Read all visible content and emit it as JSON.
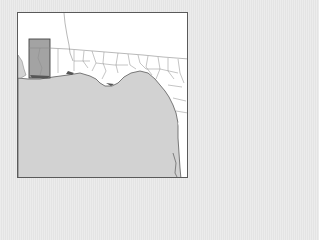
{
  "map": {
    "title": "Florida Panhandle county locator map",
    "highlighted_region": "Escambia County area",
    "colors": {
      "land": "#ffffff",
      "water": "#d2d2d2",
      "highlight": "#a3a3a3",
      "border": "#5a5a5a",
      "county_lines": "#8a8a8a",
      "background": "#e9e9e9"
    }
  }
}
